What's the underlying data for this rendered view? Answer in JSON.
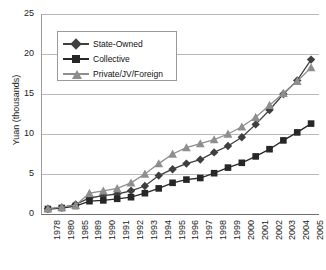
{
  "chart_data": {
    "type": "line",
    "title": "",
    "xlabel": "",
    "ylabel": "Yuan (thousands)",
    "ylim": [
      0,
      25
    ],
    "yticks": [
      0,
      5,
      10,
      15,
      20,
      25
    ],
    "grid": true,
    "legend_position": "top-left-inside",
    "categories": [
      "1978",
      "1980",
      "1985",
      "1989",
      "1990",
      "1991",
      "1992",
      "1993",
      "1994",
      "1995",
      "1996",
      "1997",
      "1998",
      "1999",
      "2000",
      "2001",
      "2002",
      "2003",
      "2004",
      "2005"
    ],
    "series": [
      {
        "name": "State-Owned",
        "marker": "diamond",
        "color": "#3f3f3f",
        "values": [
          0.65,
          0.8,
          1.2,
          2.0,
          2.3,
          2.5,
          2.9,
          3.5,
          4.8,
          5.6,
          6.3,
          6.8,
          7.7,
          8.5,
          9.6,
          11.2,
          13.0,
          15.0,
          16.7,
          19.3
        ]
      },
      {
        "name": "Collective",
        "marker": "square",
        "color": "#272727",
        "values": [
          0.62,
          0.75,
          1.0,
          1.6,
          1.7,
          1.9,
          2.1,
          2.6,
          3.2,
          3.9,
          4.3,
          4.5,
          5.1,
          5.8,
          6.4,
          7.2,
          8.1,
          9.2,
          10.2,
          11.3
        ]
      },
      {
        "name": "Private/JV/Foreign",
        "marker": "triangle",
        "color": "#8e8e8e",
        "values": [
          0.68,
          0.85,
          1.1,
          2.6,
          2.9,
          3.2,
          3.9,
          5.0,
          6.3,
          7.5,
          8.3,
          8.8,
          9.3,
          10.0,
          10.9,
          12.1,
          13.6,
          15.1,
          16.6,
          18.3
        ]
      }
    ]
  },
  "legend": {
    "items": [
      {
        "label": "State-Owned"
      },
      {
        "label": "Collective"
      },
      {
        "label": "Private/JV/Foreign"
      }
    ]
  }
}
